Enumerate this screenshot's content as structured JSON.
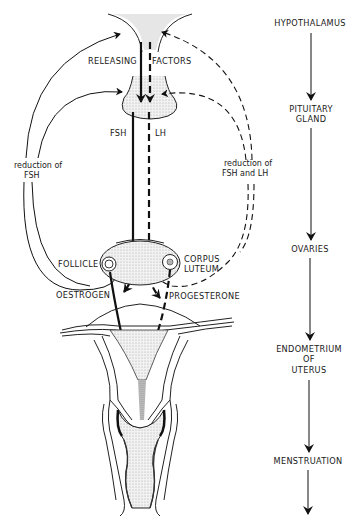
{
  "diagram": {
    "labels": {
      "releasing": "RELEASING",
      "factors": "FACTORS",
      "fsh": "FSH",
      "lh": "LH",
      "reduction_fsh_line1": "reduction of",
      "reduction_fsh_line2": "FSH",
      "reduction_fsh_lh_line1": "reduction of",
      "reduction_fsh_lh_line2": "FSH and LH",
      "follicle": "FOLLICLE",
      "corpus_line1": "CORPUS",
      "corpus_line2": "LUTEUM",
      "oestrogen": "OESTROGEN",
      "progesterone": "PROGESTERONE"
    },
    "flow_chain": [
      {
        "label_lines": [
          "HYPOTHALAMUS"
        ]
      },
      {
        "label_lines": [
          "PITUITARY",
          "GLAND"
        ]
      },
      {
        "label_lines": [
          "OVARIES"
        ]
      },
      {
        "label_lines": [
          "ENDOMETRIUM",
          "OF",
          "UTERUS"
        ]
      },
      {
        "label_lines": [
          "MENSTRUATION"
        ]
      }
    ],
    "legend_semantics": {
      "solid_line": "FSH / oestrogen pathway",
      "dashed_line": "LH / progesterone pathway"
    }
  }
}
